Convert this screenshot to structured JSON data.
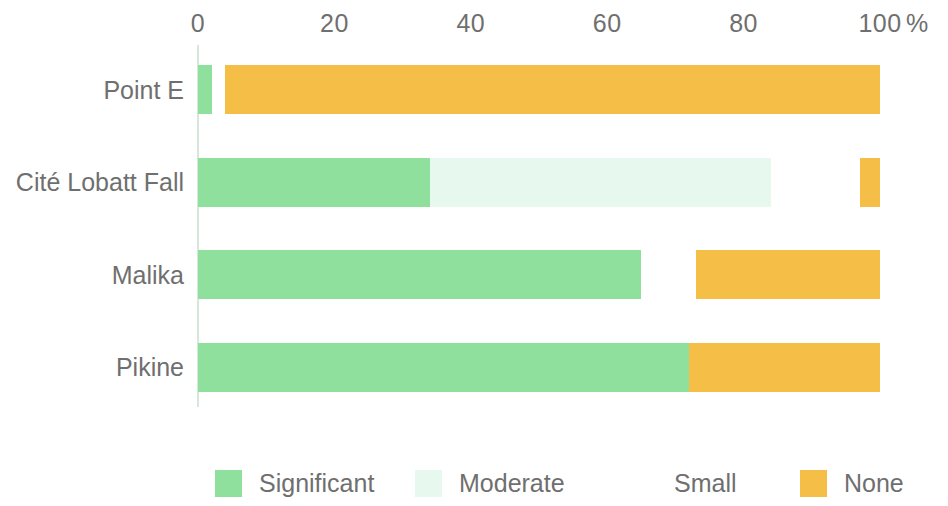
{
  "chart_data": {
    "type": "bar",
    "orientation": "horizontal",
    "stacked": true,
    "stack_mode": "percent",
    "title": "",
    "subtitle": "",
    "xlabel": "%",
    "ylabel": "",
    "xlim": [
      0,
      100
    ],
    "xticks": [
      0,
      20,
      40,
      60,
      80,
      100
    ],
    "xtick_labels": [
      "0",
      "20",
      "40",
      "60",
      "80",
      "100"
    ],
    "unit_symbol": "%",
    "grid": false,
    "legend_position": "bottom",
    "categories": [
      "Point E",
      "Cité Lobatt Fall",
      "Malika",
      "Pikine"
    ],
    "series": [
      {
        "name": "Significant",
        "color": "#8FE09C",
        "values": [
          2,
          34,
          65,
          72
        ]
      },
      {
        "name": "Moderate",
        "color": "#E7F8EF",
        "values": [
          0,
          50,
          0,
          0
        ]
      },
      {
        "name": "Small",
        "color": "#FFFFFF",
        "values": [
          2,
          13,
          8,
          0
        ]
      },
      {
        "name": "None",
        "color": "#F5BF47",
        "values": [
          96,
          3,
          27,
          28
        ]
      }
    ],
    "axis_color": "#D7E8DA",
    "text_color": "#6F6F6F"
  },
  "axis": {
    "ticks": [
      {
        "label": "0",
        "value": 0
      },
      {
        "label": "20",
        "value": 20
      },
      {
        "label": "40",
        "value": 40
      },
      {
        "label": "60",
        "value": 60
      },
      {
        "label": "80",
        "value": 80
      },
      {
        "label": "100",
        "value": 100
      }
    ],
    "unit": "%"
  },
  "categories": [
    {
      "label": "Point E"
    },
    {
      "label": "Cité Lobatt Fall"
    },
    {
      "label": "Malika"
    },
    {
      "label": "Pikine"
    }
  ],
  "legend": {
    "items": [
      {
        "label": "Significant",
        "color": "#8FE09C"
      },
      {
        "label": "Moderate",
        "color": "#E7F8EF"
      },
      {
        "label": "Small",
        "color": "#FFFFFF"
      },
      {
        "label": "None",
        "color": "#F5BF47"
      }
    ]
  }
}
